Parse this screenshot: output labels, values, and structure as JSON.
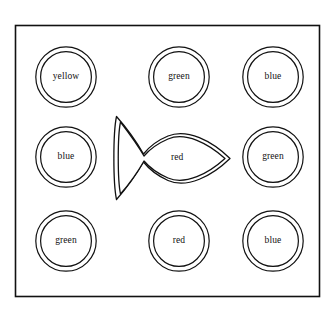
{
  "figure": {
    "title": "",
    "background_color": "#ffffff",
    "stroke_color": "#111111",
    "frame": {
      "name": "outer-border",
      "x": 15,
      "y": 25,
      "width": 305,
      "height": 272,
      "stroke_width": 1.6
    }
  },
  "grid": {
    "rows": 3,
    "columns": 3,
    "column_centers_x": [
      66,
      179,
      273
    ],
    "row_centers_y": [
      77,
      157,
      241
    ]
  },
  "shapes": [
    {
      "id": "cell-r1c1",
      "shape": "double-circle",
      "label": "yellow",
      "row": 1,
      "column": 1,
      "center_x": 66,
      "center_y": 77,
      "outer_radius": 31,
      "inner_radius": 26
    },
    {
      "id": "cell-r1c2",
      "shape": "double-circle",
      "label": "green",
      "row": 1,
      "column": 2,
      "center_x": 179,
      "center_y": 77,
      "outer_radius": 31,
      "inner_radius": 26
    },
    {
      "id": "cell-r1c3",
      "shape": "double-circle",
      "label": "blue",
      "row": 1,
      "column": 3,
      "center_x": 273,
      "center_y": 77,
      "outer_radius": 31,
      "inner_radius": 26
    },
    {
      "id": "cell-r2c1",
      "shape": "double-circle",
      "label": "blue",
      "row": 2,
      "column": 1,
      "center_x": 66,
      "center_y": 157,
      "outer_radius": 31,
      "inner_radius": 26
    },
    {
      "id": "cell-r2c2",
      "shape": "double-outline-fish",
      "label": "red",
      "row": 2,
      "column": 2,
      "center_x": 174,
      "center_y": 157,
      "direction": "points-right",
      "bbox_x": 112,
      "bbox_y": 113,
      "bbox_width": 122,
      "bbox_height": 90
    },
    {
      "id": "cell-r2c3",
      "shape": "double-circle",
      "label": "green",
      "row": 2,
      "column": 3,
      "center_x": 273,
      "center_y": 157,
      "outer_radius": 31,
      "inner_radius": 26
    },
    {
      "id": "cell-r3c1",
      "shape": "double-circle",
      "label": "green",
      "row": 3,
      "column": 1,
      "center_x": 66,
      "center_y": 241,
      "outer_radius": 31,
      "inner_radius": 26
    },
    {
      "id": "cell-r3c2",
      "shape": "double-circle",
      "label": "red",
      "row": 3,
      "column": 2,
      "center_x": 179,
      "center_y": 241,
      "outer_radius": 31,
      "inner_radius": 26
    },
    {
      "id": "cell-r3c3",
      "shape": "double-circle",
      "label": "blue",
      "row": 3,
      "column": 3,
      "center_x": 273,
      "center_y": 241,
      "outer_radius": 31,
      "inner_radius": 26
    }
  ]
}
